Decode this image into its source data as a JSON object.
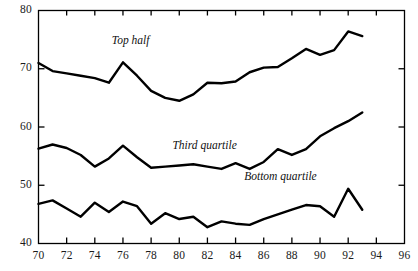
{
  "chart_data": {
    "type": "line",
    "title": "",
    "xlabel": "",
    "ylabel": "",
    "xlim": [
      70,
      96
    ],
    "ylim": [
      40,
      80
    ],
    "grid": false,
    "legend_position": "inline-annotations",
    "xticks": [
      70,
      72,
      74,
      76,
      78,
      80,
      82,
      84,
      86,
      88,
      90,
      92,
      94,
      96
    ],
    "xtick_labels": [
      "70",
      "72",
      "74",
      "76",
      "78",
      "80",
      "82",
      "84",
      "86",
      "88",
      "90",
      "92",
      "94",
      "96"
    ],
    "yticks": [
      40,
      50,
      60,
      70,
      80
    ],
    "ytick_labels": [
      "40",
      "50",
      "60",
      "70",
      "80"
    ],
    "x": [
      70,
      71,
      72,
      73,
      74,
      75,
      76,
      77,
      78,
      79,
      80,
      81,
      82,
      83,
      84,
      85,
      86,
      87,
      88,
      89,
      90,
      91,
      92,
      93
    ],
    "series": [
      {
        "name": "Top half",
        "label": "Top half",
        "label_x": 77.2,
        "label_y": 74.6,
        "color": "#000000",
        "values": [
          71.0,
          69.6,
          69.2,
          68.8,
          68.4,
          67.6,
          71.1,
          68.8,
          66.2,
          65.0,
          64.5,
          65.6,
          67.6,
          67.5,
          67.8,
          69.4,
          70.2,
          70.3,
          71.8,
          73.4,
          72.4,
          73.2,
          76.4,
          75.6
        ]
      },
      {
        "name": "Third quartile",
        "label": "Third quartile",
        "label_x": 81.5,
        "label_y": 56.6,
        "color": "#000000",
        "values": [
          56.3,
          57.0,
          56.4,
          55.2,
          53.2,
          54.6,
          56.8,
          54.8,
          53.0,
          53.2,
          53.4,
          53.6,
          53.2,
          52.8,
          53.8,
          52.8,
          54.0,
          56.2,
          55.2,
          56.2,
          58.4,
          59.8,
          61.0,
          62.5
        ]
      },
      {
        "name": "Bottom quartile",
        "label": "Bottom quartile",
        "label_x": 86.6,
        "label_y": 51.2,
        "color": "#000000",
        "values": [
          46.8,
          47.4,
          46.0,
          44.6,
          47.0,
          45.4,
          47.2,
          46.4,
          43.4,
          45.2,
          44.2,
          44.6,
          42.8,
          43.8,
          43.4,
          43.2,
          44.2,
          45.0,
          45.8,
          46.6,
          46.4,
          44.6,
          49.4,
          45.8
        ]
      }
    ]
  }
}
